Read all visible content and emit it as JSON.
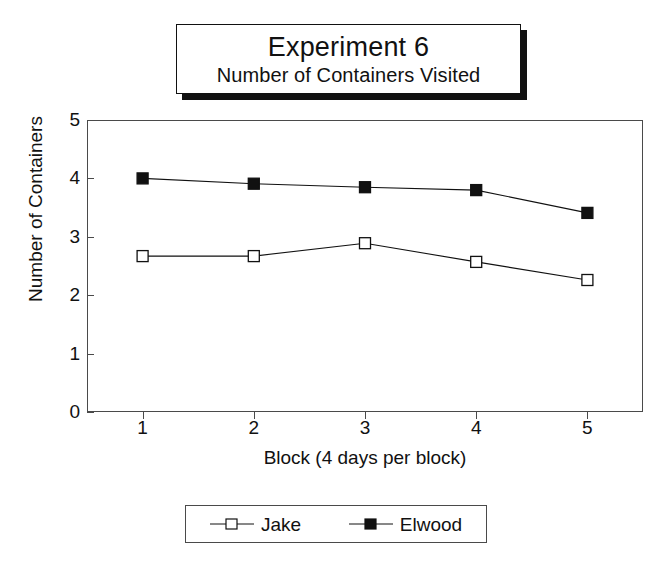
{
  "title": {
    "main": "Experiment 6",
    "subtitle": "Number of Containers Visited"
  },
  "chart_data": {
    "type": "line",
    "xlabel": "Block (4 days per block)",
    "ylabel": "Number of Containers",
    "categories": [
      "1",
      "2",
      "3",
      "4",
      "5"
    ],
    "x": [
      1,
      2,
      3,
      4,
      5
    ],
    "xlim": [
      0.5,
      5.5
    ],
    "ylim": [
      0,
      5
    ],
    "yticks": [
      "0",
      "1",
      "2",
      "3",
      "4",
      "5"
    ],
    "xticks": [
      "1",
      "2",
      "3",
      "4",
      "5"
    ],
    "grid": false,
    "legend_position": "below-axis",
    "series": [
      {
        "name": "Jake",
        "marker": "open-square",
        "color": "#111111",
        "values": [
          2.67,
          2.67,
          2.89,
          2.57,
          2.26
        ]
      },
      {
        "name": "Elwood",
        "marker": "filled-square",
        "color": "#111111",
        "values": [
          4.0,
          3.91,
          3.85,
          3.8,
          3.41
        ]
      }
    ]
  },
  "legend": {
    "entries": [
      {
        "label": "Jake",
        "marker": "open-square"
      },
      {
        "label": "Elwood",
        "marker": "filled-square"
      }
    ]
  }
}
